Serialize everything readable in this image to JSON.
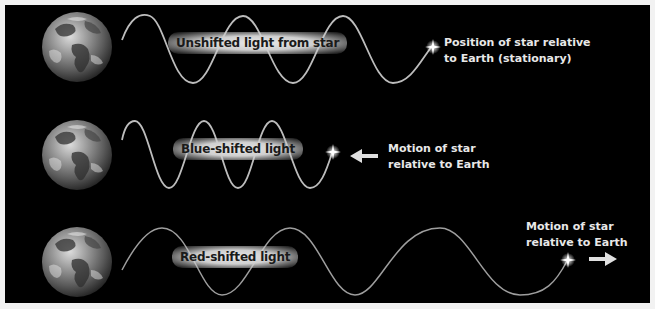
{
  "rows": [
    {
      "id": "unshifted",
      "wave_label": "Unshifted light from star",
      "caption_line1": "Position of star relative",
      "caption_line2": "to Earth (stationary)",
      "arrow": "none"
    },
    {
      "id": "blue-shifted",
      "wave_label": "Blue-shifted light",
      "caption_line1": "Motion of star",
      "caption_line2": "relative to Earth",
      "arrow": "left"
    },
    {
      "id": "red-shifted",
      "wave_label": "Red-shifted light",
      "caption_line1": "Motion of star",
      "caption_line2": "relative to Earth",
      "arrow": "right"
    }
  ],
  "icons": {
    "earth": "earth-globe-icon",
    "star": "star-sparkle-icon",
    "arrow_left": "arrow-left-icon",
    "arrow_right": "arrow-right-icon"
  },
  "colors": {
    "background": "#000000",
    "frame": "#f2f2f2",
    "wave": "#bdbdbd",
    "text": "#e8e8e8",
    "label_text": "#1a1a1a"
  }
}
